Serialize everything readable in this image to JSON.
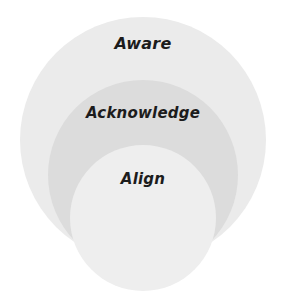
{
  "diagram": {
    "type": "nested-circles",
    "title": "",
    "background_color": "#ffffff",
    "canvas": {
      "width": 286,
      "height": 297
    },
    "levels": [
      {
        "id": "aware",
        "label": "Aware",
        "order": 1,
        "scope": "outermost",
        "fill_color": "#ebebeb",
        "center": {
          "x": 143,
          "y": 140
        },
        "radius": 123,
        "label_position": "top-inside"
      },
      {
        "id": "acknowledge",
        "label": "Acknowledge",
        "order": 2,
        "scope": "middle",
        "fill_color": "#dcdcdc",
        "center": {
          "x": 143,
          "y": 175
        },
        "radius": 95,
        "label_position": "top-inside"
      },
      {
        "id": "align",
        "label": "Align",
        "order": 3,
        "scope": "innermost",
        "fill_color": "#eeeeee",
        "center": {
          "x": 143,
          "y": 218
        },
        "radius": 73,
        "label_position": "top-inside"
      }
    ],
    "text_color": "#1c1c1c"
  },
  "chart_data": {
    "type": "pie",
    "title": "",
    "subtitle": "",
    "xlabel": "",
    "ylabel": "",
    "legend_position": "none",
    "grid": false,
    "categories": [
      "Aware",
      "Acknowledge",
      "Align"
    ],
    "values": [
      123,
      95,
      73
    ],
    "annotations": [
      "Aware",
      "Acknowledge",
      "Align"
    ]
  }
}
